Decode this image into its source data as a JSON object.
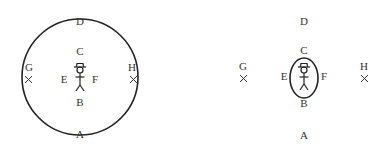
{
  "diagrams": [
    {
      "id": "left",
      "labels": {
        "top": "D",
        "upper": "C",
        "left_marker": "G",
        "right_marker": "H",
        "left": "E",
        "right": "F",
        "lower": "B",
        "bottom": "A"
      },
      "boundary": "large-circle"
    },
    {
      "id": "right",
      "labels": {
        "top": "D",
        "upper": "C",
        "left_marker": "G",
        "right_marker": "H",
        "left": "E",
        "right": "F",
        "lower": "B",
        "bottom": "A"
      },
      "boundary": "small-ellipse"
    }
  ],
  "colors": {
    "stroke": "#222222",
    "text": "#333333",
    "background": "#ffffff"
  }
}
